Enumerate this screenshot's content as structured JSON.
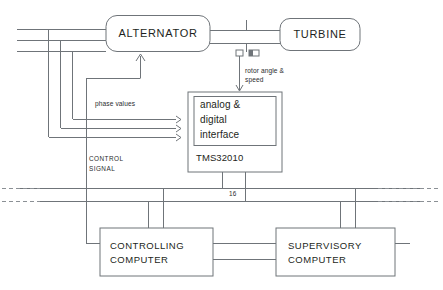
{
  "diagram": {
    "colors": {
      "wire": "#6f7479",
      "dashed_wire": "#8b9095",
      "text": "#1d1f21",
      "background": "#ffffff"
    },
    "blocks": {
      "alternator": {
        "label": "ALTERNATOR",
        "shape": "rounded-rect"
      },
      "turbine": {
        "label": "TURBINE",
        "shape": "rounded-rect"
      },
      "interface": {
        "label_line1": "analog &",
        "label_line2": "digital",
        "label_line3": "interface",
        "shape": "rect"
      },
      "processor": {
        "label": "TMS32010",
        "shape": "rect"
      },
      "controlling_computer": {
        "label_line1": "CONTROLLING",
        "label_line2": "COMPUTER",
        "shape": "rect"
      },
      "supervisory_computer": {
        "label_line1": "SUPERVISORY",
        "label_line2": "COMPUTER",
        "shape": "rect"
      }
    },
    "annotations": {
      "rotor_sensor_line1": "rotor angle &",
      "rotor_sensor_line2": "speed",
      "phase_values": "phase values",
      "control_signal_line1": "CONTROL",
      "control_signal_line2": "SIGNAL",
      "bus_width": "16"
    },
    "signals": [
      {
        "name": "three-phase-lines",
        "count": 3,
        "from": "left-edge",
        "to": "alternator"
      },
      {
        "name": "phase-values",
        "count": 3,
        "from": "phase-taps",
        "to": "interface"
      },
      {
        "name": "rotor-angle-speed",
        "from": "shaft-sensors",
        "to": "interface"
      },
      {
        "name": "control-signal",
        "from": "controlling-computer",
        "to": "alternator"
      },
      {
        "name": "data-bus",
        "width": "16",
        "from": "processor",
        "to": "computers"
      }
    ]
  }
}
